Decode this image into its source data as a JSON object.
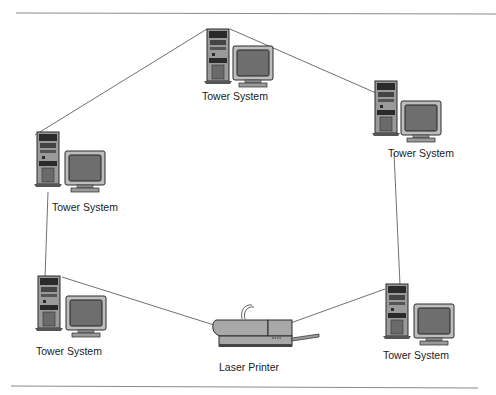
{
  "diagram": {
    "type": "ring-network",
    "nodes": [
      {
        "id": "top",
        "label": "Tower System"
      },
      {
        "id": "right-upper",
        "label": "Tower System"
      },
      {
        "id": "left-upper",
        "label": "Tower System"
      },
      {
        "id": "left-lower",
        "label": "Tower System"
      },
      {
        "id": "printer",
        "label": "Laser Printer"
      },
      {
        "id": "right-lower",
        "label": "Tower System"
      }
    ],
    "edges": [
      [
        "top",
        "right-upper"
      ],
      [
        "right-upper",
        "right-lower"
      ],
      [
        "right-lower",
        "printer"
      ],
      [
        "printer",
        "left-lower"
      ],
      [
        "left-lower",
        "left-upper"
      ],
      [
        "left-upper",
        "top"
      ]
    ]
  },
  "colors": {
    "line": "#707070",
    "device": "#9a9a9a",
    "dark": "#2a2a2a",
    "screen": "#6e6e6e"
  }
}
